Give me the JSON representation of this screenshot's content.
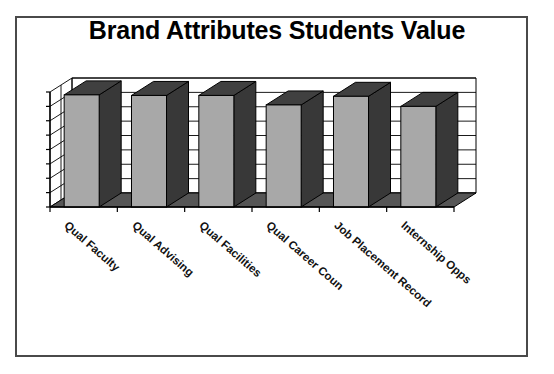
{
  "frame": {
    "border_color": "#4a4a4a"
  },
  "chart_data": {
    "type": "bar",
    "title": "Brand Attributes Students Value",
    "xlabel": "",
    "ylabel": "",
    "ylim": [
      1,
      5
    ],
    "grid": true,
    "legend": "none",
    "style": "3d-column",
    "categories": [
      "Qual Faculty",
      "Qual Advising",
      "Qual Facilities",
      "Qual Career Coun",
      "Job Placement Record",
      "Internship Opps"
    ],
    "values": [
      4.9,
      4.88,
      4.88,
      4.55,
      4.85,
      4.5
    ],
    "ytick_labels": [
      "1",
      "1.5",
      "2",
      "2.5",
      "3",
      "3.5",
      "4",
      "4.5",
      "5"
    ],
    "ytick_values": [
      1,
      1.5,
      2,
      2.5,
      3,
      3.5,
      4,
      4.5,
      5
    ],
    "colors": {
      "bar_front": "#a8a8a8",
      "bar_side": "#383838",
      "bar_top": "#404040",
      "floor": "#555555",
      "plot_background": "#ffffff",
      "axis": "#000000",
      "gridline": "#000000"
    }
  }
}
